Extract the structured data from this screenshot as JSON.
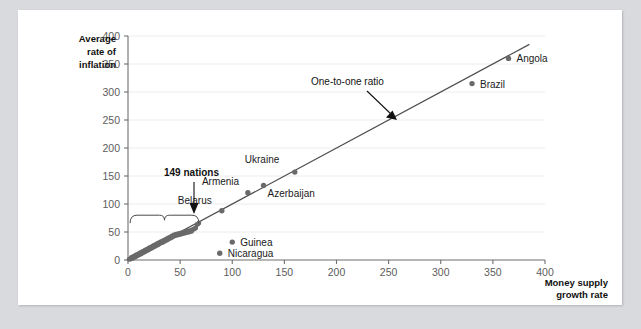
{
  "chart_data": {
    "type": "scatter",
    "title": "",
    "xlabel": "Money supply growth rate",
    "ylabel": "Average rate of inflation",
    "xlim": [
      0,
      400
    ],
    "ylim": [
      0,
      400
    ],
    "xticks": [
      0,
      50,
      100,
      150,
      200,
      250,
      300,
      350,
      400
    ],
    "yticks": [
      0,
      50,
      100,
      150,
      200,
      250,
      300,
      350,
      400
    ],
    "grid": "horizontal",
    "legend": "none",
    "reference_line": {
      "label": "One-to-one ratio",
      "slope": 1,
      "intercept": 0,
      "from": [
        0,
        0
      ],
      "to": [
        385,
        385
      ]
    },
    "labeled_points": [
      {
        "name": "Belarus",
        "x": 90,
        "y": 88,
        "label_dx": -44,
        "label_dy": -7
      },
      {
        "name": "Armenia",
        "x": 115,
        "y": 120,
        "label_dx": -46,
        "label_dy": -8
      },
      {
        "name": "Azerbaijan",
        "x": 130,
        "y": 133,
        "label_dx": 4,
        "label_dy": 11
      },
      {
        "name": "Ukraine",
        "x": 160,
        "y": 157,
        "label_dx": -50,
        "label_dy": -9
      },
      {
        "name": "Brazil",
        "x": 330,
        "y": 315,
        "label_dx": 8,
        "label_dy": 4
      },
      {
        "name": "Angola",
        "x": 365,
        "y": 360,
        "label_dx": 8,
        "label_dy": 4
      },
      {
        "name": "Guinea",
        "x": 100,
        "y": 32,
        "label_dx": 8,
        "label_dy": 4
      },
      {
        "name": "Nicaragua",
        "x": 88,
        "y": 12,
        "label_dx": 8,
        "label_dy": 4
      }
    ],
    "cluster": {
      "annotation": "149 nations",
      "brace_x_range": [
        2,
        68
      ],
      "brace_y": 80,
      "points": [
        [
          1,
          1
        ],
        [
          2,
          2
        ],
        [
          2.5,
          1.5
        ],
        [
          3,
          4
        ],
        [
          3.5,
          2.5
        ],
        [
          4,
          5
        ],
        [
          4.5,
          3
        ],
        [
          5,
          6
        ],
        [
          5.5,
          4
        ],
        [
          6,
          7
        ],
        [
          6.5,
          5
        ],
        [
          7,
          8
        ],
        [
          7.5,
          6
        ],
        [
          8,
          9
        ],
        [
          8.5,
          7
        ],
        [
          9,
          10
        ],
        [
          9.5,
          8
        ],
        [
          10,
          11
        ],
        [
          10.5,
          9
        ],
        [
          11,
          12
        ],
        [
          11.5,
          10
        ],
        [
          12,
          13
        ],
        [
          12.5,
          11
        ],
        [
          13,
          14
        ],
        [
          13.5,
          12
        ],
        [
          14,
          15
        ],
        [
          14.5,
          13
        ],
        [
          15,
          16
        ],
        [
          15.5,
          14
        ],
        [
          16,
          17
        ],
        [
          16.5,
          15
        ],
        [
          17,
          18
        ],
        [
          17.5,
          16
        ],
        [
          18,
          19
        ],
        [
          18.5,
          17
        ],
        [
          19,
          20
        ],
        [
          19.5,
          18
        ],
        [
          20,
          21
        ],
        [
          20.5,
          19
        ],
        [
          21,
          22
        ],
        [
          21.5,
          20
        ],
        [
          22,
          23
        ],
        [
          22.5,
          21
        ],
        [
          23,
          24
        ],
        [
          23.5,
          22
        ],
        [
          24,
          25
        ],
        [
          24.5,
          23
        ],
        [
          25,
          26
        ],
        [
          25.5,
          24
        ],
        [
          26,
          27
        ],
        [
          26.5,
          25
        ],
        [
          27,
          28
        ],
        [
          27.5,
          26
        ],
        [
          28,
          29
        ],
        [
          28.5,
          27
        ],
        [
          29,
          30
        ],
        [
          29.5,
          28
        ],
        [
          30,
          31
        ],
        [
          30.5,
          29
        ],
        [
          31,
          32
        ],
        [
          32,
          33
        ],
        [
          33,
          31
        ],
        [
          34,
          35
        ],
        [
          35,
          33
        ],
        [
          36,
          37
        ],
        [
          37,
          35
        ],
        [
          38,
          39
        ],
        [
          39,
          37
        ],
        [
          40,
          41
        ],
        [
          41,
          39
        ],
        [
          42,
          43
        ],
        [
          43,
          41
        ],
        [
          44,
          45
        ],
        [
          45,
          43
        ],
        [
          46,
          46
        ],
        [
          47,
          44
        ],
        [
          48,
          47
        ],
        [
          49,
          45
        ],
        [
          50,
          48
        ],
        [
          51,
          46
        ],
        [
          52,
          49
        ],
        [
          53,
          47
        ],
        [
          54,
          50
        ],
        [
          55,
          48
        ],
        [
          56,
          51
        ],
        [
          57,
          49
        ],
        [
          58,
          52
        ],
        [
          59,
          50
        ],
        [
          60,
          53
        ],
        [
          61,
          51
        ],
        [
          62,
          54
        ],
        [
          63,
          55
        ],
        [
          64,
          56
        ],
        [
          65,
          57
        ],
        [
          66,
          63
        ],
        [
          67,
          64
        ],
        [
          68,
          66
        ]
      ]
    }
  }
}
